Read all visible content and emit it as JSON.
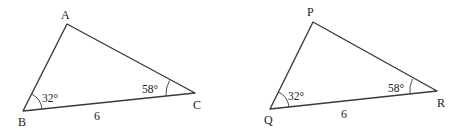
{
  "figures": [
    {
      "name": "triangle-ABC",
      "vertices": {
        "A": {
          "label": "A",
          "x": 67,
          "y": 24
        },
        "B": {
          "label": "B",
          "x": 23,
          "y": 111
        },
        "C": {
          "label": "C",
          "x": 195,
          "y": 93
        }
      },
      "angles": {
        "B": "32°",
        "C": "58°"
      },
      "side_BC": "6"
    },
    {
      "name": "triangle-PQR",
      "vertices": {
        "P": {
          "label": "P",
          "x": 313,
          "y": 22
        },
        "Q": {
          "label": "Q",
          "x": 270,
          "y": 109
        },
        "R": {
          "label": "R",
          "x": 437,
          "y": 91
        }
      },
      "angles": {
        "Q": "32°",
        "R": "58°"
      },
      "side_QR": "6"
    }
  ]
}
